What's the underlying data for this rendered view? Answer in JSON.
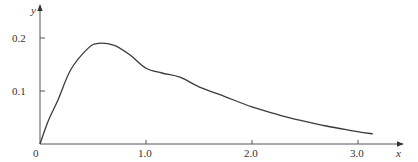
{
  "chart_data": {
    "type": "line",
    "title": "",
    "xlabel": "x",
    "ylabel": "y",
    "xlim": [
      0,
      3.3
    ],
    "ylim": [
      0,
      0.21
    ],
    "grid": false,
    "legend": null,
    "x_ticks": [
      {
        "value": 0,
        "label": "0"
      },
      {
        "value": 1.0,
        "label": "1.0"
      },
      {
        "value": 2.0,
        "label": "2.0"
      },
      {
        "value": 3.0,
        "label": "3.0"
      }
    ],
    "y_ticks": [
      {
        "value": 0.1,
        "label": "0.1"
      },
      {
        "value": 0.2,
        "label": "0.2"
      }
    ],
    "series": [
      {
        "name": "y(x)",
        "color": "#3a3a3a",
        "x": [
          0,
          0.08,
          0.17,
          0.29,
          0.45,
          0.55,
          0.7,
          0.85,
          1.0,
          1.15,
          1.32,
          1.5,
          1.75,
          2.0,
          2.25,
          2.45,
          2.7,
          2.95,
          3.14
        ],
        "y": [
          0,
          0.045,
          0.083,
          0.14,
          0.18,
          0.19,
          0.186,
          0.168,
          0.143,
          0.134,
          0.126,
          0.108,
          0.089,
          0.07,
          0.055,
          0.045,
          0.034,
          0.025,
          0.019
        ]
      }
    ]
  },
  "axes": {
    "origin_label": "0",
    "x_axis_label": "x",
    "y_axis_label": "y"
  }
}
